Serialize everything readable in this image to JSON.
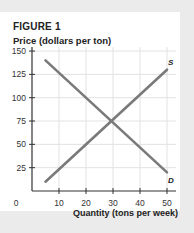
{
  "figure": {
    "title": "FIGURE 1",
    "ylabel": "Price (dollars per ton)",
    "xlabel": "Quantity (tons per week)"
  },
  "colors": {
    "background": "#ebebeb",
    "panel": "#ffffff",
    "grid": "#e2e2e2",
    "axis": "#333333",
    "curve": "#7a7a7a"
  },
  "chart_data": {
    "type": "line",
    "title": "FIGURE 1",
    "xlabel": "Quantity (tons per week)",
    "ylabel": "Price (dollars per ton)",
    "xlim": [
      0,
      55
    ],
    "ylim": [
      0,
      150
    ],
    "xticks": [
      0,
      10,
      20,
      30,
      40,
      50
    ],
    "yticks": [
      25,
      50,
      75,
      100,
      125,
      150
    ],
    "grid": true,
    "series": [
      {
        "name": "D",
        "label": "D",
        "x": [
          5,
          50
        ],
        "y": [
          140,
          20
        ]
      },
      {
        "name": "S",
        "label": "S",
        "x": [
          5,
          50
        ],
        "y": [
          10,
          130
        ]
      }
    ],
    "equilibrium": {
      "quantity": 30,
      "price": 75
    }
  }
}
